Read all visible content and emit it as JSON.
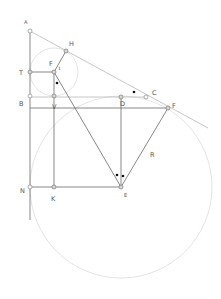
{
  "diagram": {
    "type": "geometry-construction",
    "points": {
      "A": {
        "label": "A"
      },
      "H": {
        "label": "H"
      },
      "T": {
        "label": "T"
      },
      "F1": {
        "label": "F"
      },
      "I": {
        "label": "1"
      },
      "B": {
        "label": "B"
      },
      "V": {
        "label": "V"
      },
      "D": {
        "label": "D"
      },
      "C": {
        "label": "C"
      },
      "F2": {
        "label": "F"
      },
      "R": {
        "label": "R"
      },
      "N": {
        "label": "N"
      },
      "K": {
        "label": "K"
      },
      "E": {
        "label": "E"
      }
    },
    "angle_marks": [
      "single-dot near F",
      "single-dot near C",
      "double-dot at E"
    ]
  }
}
